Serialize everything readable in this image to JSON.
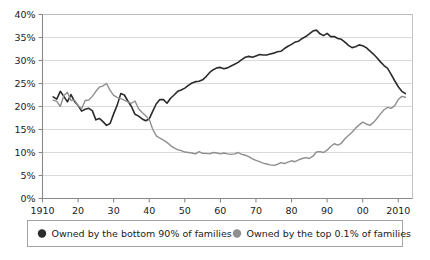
{
  "chart_data": {
    "type": "line",
    "title": "",
    "xlabel": "",
    "ylabel": "",
    "xlim": [
      1910,
      2014
    ],
    "ylim": [
      0,
      40
    ],
    "grid": true,
    "legend_position": "bottom",
    "y_ticks": [
      0,
      5,
      10,
      15,
      20,
      25,
      30,
      35,
      40
    ],
    "y_tick_labels": [
      "0%",
      "5%",
      "10%",
      "15%",
      "20%",
      "25%",
      "30%",
      "35%",
      "40%"
    ],
    "x_ticks": [
      1910,
      1920,
      1930,
      1940,
      1950,
      1960,
      1970,
      1980,
      1990,
      2000,
      2010
    ],
    "x_tick_labels": [
      "1910",
      "20",
      "30",
      "40",
      "50",
      "60",
      "70",
      "80",
      "90",
      "00",
      "2010"
    ],
    "series": [
      {
        "name": "Owned by the bottom 90% of families",
        "color": "#2b2b2b",
        "width": 1.6,
        "x": [
          1913,
          1914,
          1915,
          1916,
          1917,
          1918,
          1919,
          1920,
          1921,
          1922,
          1923,
          1924,
          1925,
          1926,
          1927,
          1928,
          1929,
          1930,
          1931,
          1932,
          1933,
          1934,
          1935,
          1936,
          1937,
          1938,
          1939,
          1940,
          1941,
          1942,
          1943,
          1944,
          1945,
          1946,
          1947,
          1948,
          1949,
          1950,
          1951,
          1952,
          1953,
          1954,
          1955,
          1956,
          1957,
          1958,
          1959,
          1960,
          1961,
          1962,
          1963,
          1964,
          1965,
          1966,
          1967,
          1968,
          1969,
          1970,
          1971,
          1972,
          1973,
          1974,
          1975,
          1976,
          1977,
          1978,
          1979,
          1980,
          1981,
          1982,
          1983,
          1984,
          1985,
          1986,
          1987,
          1988,
          1989,
          1990,
          1991,
          1992,
          1993,
          1994,
          1995,
          1996,
          1997,
          1998,
          1999,
          2000,
          2001,
          2002,
          2003,
          2004,
          2005,
          2006,
          2007,
          2008,
          2009,
          2010,
          2011,
          2012
        ],
        "y": [
          22.1,
          21.6,
          23.3,
          22.2,
          21.0,
          22.6,
          21.1,
          20.2,
          19.0,
          19.4,
          19.6,
          19.1,
          17.1,
          17.4,
          16.7,
          15.9,
          16.3,
          18.4,
          20.3,
          22.8,
          22.5,
          21.2,
          20.0,
          18.3,
          17.9,
          17.3,
          16.9,
          17.3,
          19.0,
          20.6,
          21.5,
          21.5,
          20.7,
          21.8,
          22.5,
          23.3,
          23.6,
          24.0,
          24.6,
          25.1,
          25.4,
          25.5,
          25.8,
          26.5,
          27.4,
          28.0,
          28.4,
          28.5,
          28.2,
          28.4,
          28.8,
          29.2,
          29.6,
          30.2,
          30.7,
          30.9,
          30.7,
          31.0,
          31.3,
          31.2,
          31.2,
          31.4,
          31.6,
          31.9,
          32.0,
          32.6,
          33.1,
          33.5,
          34.0,
          34.2,
          34.8,
          35.2,
          35.8,
          36.4,
          36.6,
          35.8,
          35.4,
          35.9,
          35.2,
          35.2,
          34.8,
          34.6,
          34.0,
          33.3,
          32.8,
          33.0,
          33.4,
          33.2,
          32.8,
          32.1,
          31.4,
          30.6,
          29.7,
          28.9,
          28.3,
          27.0,
          25.6,
          24.3,
          23.3,
          22.8
        ]
      },
      {
        "name": "Owned by the top 0.1% of families",
        "color": "#8f8f8f",
        "width": 1.4,
        "x": [
          1913,
          1914,
          1915,
          1916,
          1917,
          1918,
          1919,
          1920,
          1921,
          1922,
          1923,
          1924,
          1925,
          1926,
          1927,
          1928,
          1929,
          1930,
          1931,
          1932,
          1933,
          1934,
          1935,
          1936,
          1937,
          1938,
          1939,
          1940,
          1941,
          1942,
          1943,
          1944,
          1945,
          1946,
          1947,
          1948,
          1949,
          1950,
          1951,
          1952,
          1953,
          1954,
          1955,
          1956,
          1957,
          1958,
          1959,
          1960,
          1961,
          1962,
          1963,
          1964,
          1965,
          1966,
          1967,
          1968,
          1969,
          1970,
          1971,
          1972,
          1973,
          1974,
          1975,
          1976,
          1977,
          1978,
          1979,
          1980,
          1981,
          1982,
          1983,
          1984,
          1985,
          1986,
          1987,
          1988,
          1989,
          1990,
          1991,
          1992,
          1993,
          1994,
          1995,
          1996,
          1997,
          1998,
          1999,
          2000,
          2001,
          2002,
          2003,
          2004,
          2005,
          2006,
          2007,
          2008,
          2009,
          2010,
          2011,
          2012
        ],
        "y": [
          21.4,
          21.1,
          20.0,
          22.4,
          23.1,
          21.3,
          21.4,
          20.2,
          19.5,
          21.3,
          21.4,
          22.2,
          23.3,
          24.2,
          24.5,
          25.0,
          23.5,
          22.4,
          22.0,
          21.7,
          21.4,
          21.0,
          20.7,
          21.2,
          19.5,
          18.7,
          18.0,
          17.2,
          15.0,
          13.6,
          13.1,
          12.7,
          12.2,
          11.5,
          11.0,
          10.6,
          10.4,
          10.1,
          10.0,
          9.9,
          9.7,
          10.2,
          9.8,
          9.8,
          9.7,
          10.0,
          9.9,
          9.7,
          9.9,
          9.7,
          9.6,
          9.7,
          10.0,
          9.6,
          9.4,
          9.1,
          8.6,
          8.3,
          8.0,
          7.7,
          7.5,
          7.3,
          7.2,
          7.4,
          7.8,
          7.6,
          7.9,
          8.2,
          8.0,
          8.4,
          8.7,
          8.9,
          8.7,
          9.2,
          10.1,
          10.2,
          10.0,
          10.5,
          11.3,
          11.9,
          11.6,
          12.0,
          13.0,
          13.7,
          14.4,
          15.3,
          16.0,
          16.6,
          16.2,
          15.9,
          16.5,
          17.4,
          18.4,
          19.3,
          19.8,
          19.6,
          20.2,
          21.5,
          22.2,
          22.0
        ]
      }
    ]
  },
  "legend": {
    "items": [
      {
        "label": "Owned by the bottom 90% of families",
        "color": "#2b2b2b"
      },
      {
        "label": "Owned by the top 0.1% of families",
        "color": "#8f8f8f"
      }
    ]
  }
}
